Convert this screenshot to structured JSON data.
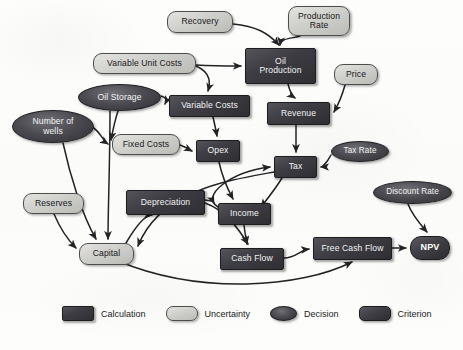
{
  "diagram": {
    "background_color": "#fdfdfb",
    "node_types": {
      "calculation": {
        "label": "Calculation",
        "fill": "#3d3d43",
        "text": "#f2f2f2",
        "shape": "rectangle"
      },
      "uncertainty": {
        "label": "Uncertainty",
        "fill": "#cfcfcb",
        "text": "#18181a",
        "shape": "rounded-rectangle"
      },
      "decision": {
        "label": "Decision",
        "fill": "#4b4b51",
        "text": "#f3f3f3",
        "shape": "ellipse"
      },
      "criterion": {
        "label": "Criterion",
        "fill": "#3f3f45",
        "text": "#ffffff",
        "shape": "rounded-rectangle-bold"
      }
    },
    "nodes": [
      {
        "id": "recovery",
        "label": "Recovery",
        "type": "uncertainty",
        "x": 167,
        "y": 11,
        "w": 66,
        "h": 22,
        "font": 8.6
      },
      {
        "id": "production-rate",
        "label": "Production\nRate",
        "type": "uncertainty",
        "x": 288,
        "y": 6,
        "w": 62,
        "h": 30,
        "font": 8.6
      },
      {
        "id": "variable-unit-costs",
        "label": "Variable Unit Costs",
        "type": "uncertainty",
        "x": 93,
        "y": 53,
        "w": 103,
        "h": 21,
        "font": 8.6
      },
      {
        "id": "oil-production",
        "label": "Oil\nProduction",
        "type": "calculation",
        "x": 245,
        "y": 48,
        "w": 71,
        "h": 36,
        "font": 8.6
      },
      {
        "id": "price",
        "label": "Price",
        "type": "uncertainty",
        "x": 334,
        "y": 64,
        "w": 44,
        "h": 21,
        "font": 8.6
      },
      {
        "id": "oil-storage",
        "label": "Oil Storage",
        "type": "decision",
        "x": 78,
        "y": 84,
        "w": 83,
        "h": 27,
        "font": 8.6
      },
      {
        "id": "variable-costs",
        "label": "Variable Costs",
        "type": "calculation",
        "x": 169,
        "y": 95,
        "w": 81,
        "h": 22,
        "font": 8.6
      },
      {
        "id": "revenue",
        "label": "Revenue",
        "type": "calculation",
        "x": 267,
        "y": 102,
        "w": 63,
        "h": 23,
        "font": 8.6
      },
      {
        "id": "number-of-wells",
        "label": "Number of\nwells",
        "type": "decision",
        "x": 12,
        "y": 110,
        "w": 82,
        "h": 33,
        "font": 8.6
      },
      {
        "id": "fixed-costs",
        "label": "Fixed Costs",
        "type": "uncertainty",
        "x": 112,
        "y": 134,
        "w": 68,
        "h": 21,
        "font": 8.6
      },
      {
        "id": "opex",
        "label": "Opex",
        "type": "calculation",
        "x": 196,
        "y": 140,
        "w": 44,
        "h": 22,
        "font": 8.6
      },
      {
        "id": "tax",
        "label": "Tax",
        "type": "calculation",
        "x": 274,
        "y": 156,
        "w": 43,
        "h": 22,
        "font": 8.6
      },
      {
        "id": "tax-rate",
        "label": "Tax Rate",
        "type": "decision",
        "x": 331,
        "y": 141,
        "w": 58,
        "h": 21,
        "font": 8.2
      },
      {
        "id": "discount-rate",
        "label": "Discount Rate",
        "type": "decision",
        "x": 373,
        "y": 181,
        "w": 79,
        "h": 23,
        "font": 8.2
      },
      {
        "id": "depreciation",
        "label": "Depreciation",
        "type": "calculation",
        "x": 126,
        "y": 190,
        "w": 79,
        "h": 25,
        "font": 8.6
      },
      {
        "id": "income",
        "label": "Income",
        "type": "calculation",
        "x": 218,
        "y": 203,
        "w": 53,
        "h": 22,
        "font": 8.6
      },
      {
        "id": "reserves",
        "label": "Reserves",
        "type": "uncertainty",
        "x": 23,
        "y": 193,
        "w": 61,
        "h": 21,
        "font": 8.6
      },
      {
        "id": "capital",
        "label": "Capital",
        "type": "uncertainty",
        "x": 79,
        "y": 243,
        "w": 55,
        "h": 22,
        "font": 8.6
      },
      {
        "id": "cash-flow",
        "label": "Cash Flow",
        "type": "calculation",
        "x": 220,
        "y": 248,
        "w": 64,
        "h": 22,
        "font": 8.6
      },
      {
        "id": "free-cash-flow",
        "label": "Free Cash Flow",
        "type": "calculation",
        "x": 313,
        "y": 237,
        "w": 79,
        "h": 23,
        "font": 8.6
      },
      {
        "id": "npv",
        "label": "NPV",
        "type": "criterion",
        "x": 410,
        "y": 236,
        "w": 40,
        "h": 24,
        "font": 9
      }
    ],
    "edges": [
      {
        "from": "recovery",
        "to": "oil-production",
        "path": "M 233,24 C 256,26 268,33 279,45"
      },
      {
        "from": "production-rate",
        "to": "oil-production",
        "path": "M 300,36 C 290,39 281,38 280,45"
      },
      {
        "from": "variable-unit-costs",
        "to": "oil-production",
        "path": "M 196,65 C 214,66 224,66 241,66"
      },
      {
        "from": "variable-unit-costs",
        "to": "variable-costs",
        "path": "M 196,66 C 212,73 210,84 208,91"
      },
      {
        "from": "oil-storage",
        "to": "variable-costs",
        "path": "M 161,96 C 167,98 167,100 165,104"
      },
      {
        "from": "oil-storage",
        "to": "fixed-costs",
        "path": "M 118,111 C 115,120 114,124 111,140"
      },
      {
        "from": "oil-production",
        "to": "revenue",
        "path": "M 288,84 C 290,92 292,96 295,98"
      },
      {
        "from": "price",
        "to": "revenue",
        "path": "M 345,85 C 342,96 338,105 334,112"
      },
      {
        "from": "number-of-wells",
        "to": "fixed-costs",
        "path": "M 92,127 C 100,131 102,140 108,144"
      },
      {
        "from": "variable-costs",
        "to": "opex",
        "path": "M 213,117 C 215,126 216,130 217,136"
      },
      {
        "from": "fixed-costs",
        "to": "opex",
        "path": "M 180,145 C 186,147 188,149 192,151"
      },
      {
        "from": "revenue",
        "to": "tax",
        "path": "M 296,125 C 296,137 296,145 296,152"
      },
      {
        "from": "tax-rate",
        "to": "tax",
        "path": "M 331,155 C 326,164 322,167 321,167"
      },
      {
        "from": "opex",
        "to": "income",
        "path": "M 219,162 C 222,176 226,186 233,199"
      },
      {
        "from": "tax",
        "to": "income",
        "path": "M 282,178 C 276,188 268,198 261,207"
      },
      {
        "from": "depreciation",
        "to": "income",
        "path": "M 205,200 C 212,201 213,201 214,203"
      },
      {
        "from": "depreciation",
        "to": "cash-flow",
        "path": "M 205,203 C 225,210 238,228 248,244"
      },
      {
        "from": "income",
        "to": "cash-flow",
        "path": "M 244,225 C 245,234 246,239 247,244"
      },
      {
        "from": "reserves",
        "to": "capital",
        "path": "M 54,214 C 60,228 68,240 76,248"
      },
      {
        "from": "number-of-wells",
        "to": "capital",
        "path": "M 63,143 C 70,175 82,215 96,239"
      },
      {
        "from": "oil-storage",
        "to": "capital",
        "path": "M 110,111 C 110,160 108,210 108,239"
      },
      {
        "from": "capital",
        "to": "depreciation",
        "path": "M 126,243 C 136,226 145,215 152,215"
      },
      {
        "from": "capital",
        "to": "free-cash-flow",
        "path": "M 118,261 C 200,295 300,288 352,262"
      },
      {
        "from": "cash-flow",
        "to": "free-cash-flow",
        "path": "M 284,258 C 296,258 300,250 309,249"
      },
      {
        "from": "free-cash-flow",
        "to": "npv",
        "path": "M 392,248 C 399,248 402,248 406,248"
      },
      {
        "from": "discount-rate",
        "to": "npv",
        "path": "M 408,204 C 412,215 420,224 427,232"
      },
      {
        "from": "tax",
        "to": "capital",
        "path": "M 274,172 C 230,180 160,190 138,246"
      },
      {
        "from": "income",
        "to": "tax",
        "path": "M 218,207 C 200,196 230,172 270,167"
      }
    ],
    "legend": [
      {
        "key": "calculation",
        "label": "Calculation"
      },
      {
        "key": "uncertainty",
        "label": "Uncertainty"
      },
      {
        "key": "decision",
        "label": "Decision"
      },
      {
        "key": "criterion",
        "label": "Criterion"
      }
    ]
  }
}
